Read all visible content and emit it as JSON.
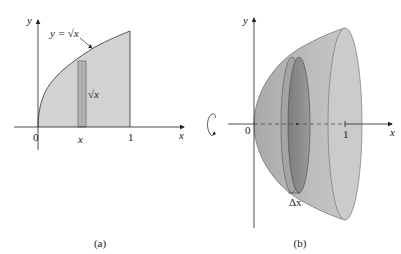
{
  "figure": {
    "panel_a": {
      "caption": "(a)",
      "axis_x_label": "x",
      "axis_y_label": "y",
      "origin_label": "0",
      "tick_x_label": "x",
      "tick_one_label": "1",
      "curve_label": "y = √x",
      "strip_height_label": "√x",
      "fill_color": "#cfcfcf",
      "strip_color": "#b5b5b5"
    },
    "panel_b": {
      "caption": "(b)",
      "axis_x_label": "x",
      "axis_y_label": "y",
      "origin_label": "0",
      "tick_one_label": "1",
      "disk_width_label": "Δx",
      "solid_color": "#bdbdbd",
      "end_face_color": "#cdcdcd",
      "disk_color": "#8c8c8c",
      "rotation_icon": "rotation-arrow"
    }
  }
}
